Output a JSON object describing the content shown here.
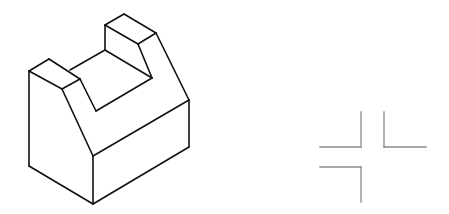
{
  "figure": {
    "colors": {
      "background": "#ffffff",
      "object_stroke": "#111111",
      "marks_stroke": "#8a8a8a"
    }
  },
  "isometric_object": {
    "segments": [
      [
        29,
        71,
        49,
        59
      ],
      [
        49,
        59,
        80,
        79
      ],
      [
        80,
        79,
        62,
        89
      ],
      [
        62,
        89,
        29,
        71
      ],
      [
        29,
        71,
        29,
        166
      ],
      [
        29,
        166,
        93,
        204
      ],
      [
        93,
        204,
        189,
        147
      ],
      [
        93,
        156,
        93,
        204
      ],
      [
        62,
        89,
        93,
        156
      ],
      [
        93,
        156,
        189,
        100
      ],
      [
        189,
        100,
        189,
        147
      ],
      [
        105,
        25,
        124,
        14
      ],
      [
        124,
        14,
        156,
        33
      ],
      [
        156,
        33,
        138,
        44
      ],
      [
        138,
        44,
        105,
        25
      ],
      [
        105,
        25,
        105,
        50
      ],
      [
        156,
        33,
        189,
        100
      ],
      [
        138,
        44,
        152,
        78
      ],
      [
        105,
        50,
        152,
        78
      ],
      [
        105,
        50,
        70,
        70
      ],
      [
        80,
        79,
        96,
        111
      ],
      [
        96,
        111,
        152,
        78
      ]
    ]
  },
  "view_marks": {
    "segments": [
      [
        361,
        112,
        361,
        147
      ],
      [
        320,
        147,
        361,
        147
      ],
      [
        384,
        112,
        384,
        147
      ],
      [
        384,
        147,
        426,
        147
      ],
      [
        320,
        167,
        361,
        167
      ],
      [
        361,
        167,
        361,
        202
      ]
    ]
  }
}
